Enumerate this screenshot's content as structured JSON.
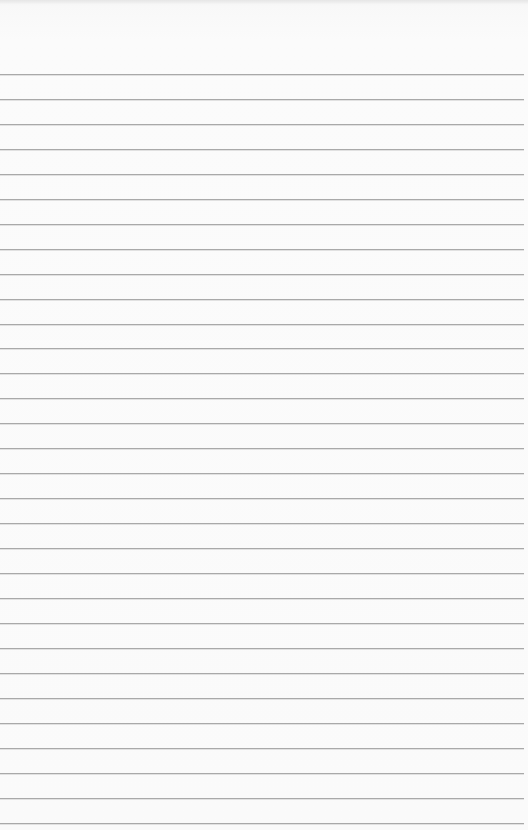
{
  "page": {
    "type": "lined-paper",
    "background_color": "#fafafa",
    "rule_color": "#a9a9a9",
    "first_rule_y": 74,
    "rule_spacing": 24.95,
    "rule_count": 31,
    "text_content": ""
  }
}
